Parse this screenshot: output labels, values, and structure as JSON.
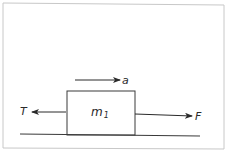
{
  "diagram": {
    "block": {
      "label": "m",
      "subscript": "1"
    },
    "forces": [
      {
        "name": "tension",
        "label": "T",
        "direction": "left"
      },
      {
        "name": "applied-force",
        "label": "F",
        "direction": "right"
      }
    ],
    "acceleration": {
      "label": "a",
      "direction": "right"
    },
    "colors": {
      "ink": "#2a2a2a",
      "frame": "#c8c8c8",
      "background": "#ffffff"
    }
  }
}
